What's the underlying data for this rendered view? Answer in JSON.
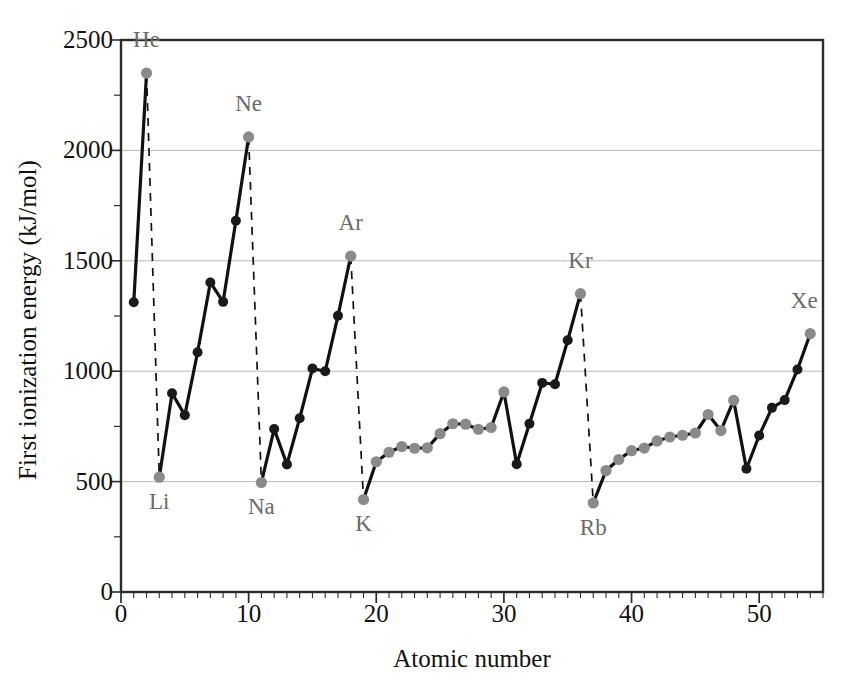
{
  "chart_data": {
    "type": "line",
    "title": "",
    "xlabel": "Atomic number",
    "ylabel": "First ionization energy (kJ/mol)",
    "xlim": [
      0,
      55
    ],
    "ylim": [
      0,
      2500
    ],
    "grid": true,
    "legend": null,
    "x_major_ticks": [
      0,
      10,
      20,
      30,
      40,
      50
    ],
    "x_tick_labels": [
      "0",
      "10",
      "20",
      "30",
      "40",
      "50"
    ],
    "x_minor_tick_step": 1,
    "y_major_ticks": [
      0,
      500,
      1000,
      1500,
      2000,
      2500
    ],
    "y_tick_labels": [
      "0",
      "500",
      "1000",
      "1500",
      "2000",
      "2500"
    ],
    "y_minor_tick_step": 250,
    "series_name": "First ionization energy",
    "x": [
      1,
      2,
      3,
      4,
      5,
      6,
      7,
      8,
      9,
      10,
      11,
      12,
      13,
      14,
      15,
      16,
      17,
      18,
      19,
      20,
      21,
      22,
      23,
      24,
      25,
      26,
      27,
      28,
      29,
      30,
      31,
      32,
      33,
      34,
      35,
      36,
      37,
      38,
      39,
      40,
      41,
      42,
      43,
      44,
      45,
      46,
      47,
      48,
      49,
      50,
      51,
      52,
      53,
      54
    ],
    "values": [
      1312,
      2350,
      520,
      900,
      801,
      1086,
      1402,
      1314,
      1681,
      2061,
      496,
      738,
      578,
      787,
      1012,
      1000,
      1251,
      1521,
      419,
      590,
      633,
      659,
      651,
      653,
      717,
      762,
      760,
      737,
      745,
      906,
      579,
      762,
      947,
      941,
      1140,
      1351,
      403,
      550,
      600,
      640,
      652,
      684,
      702,
      710,
      720,
      804,
      731,
      868,
      558,
      709,
      834,
      869,
      1008,
      1170
    ],
    "annotations": [
      {
        "element": "He",
        "x": 2,
        "y": 2350,
        "dx": 0,
        "dy": -26,
        "anchor": "middle"
      },
      {
        "element": "Ne",
        "x": 10,
        "y": 2061,
        "dx": 0,
        "dy": -26,
        "anchor": "middle"
      },
      {
        "element": "Ar",
        "x": 18,
        "y": 1521,
        "dx": 0,
        "dy": -26,
        "anchor": "middle"
      },
      {
        "element": "Kr",
        "x": 36,
        "y": 1351,
        "dx": 0,
        "dy": -26,
        "anchor": "middle"
      },
      {
        "element": "Xe",
        "x": 54,
        "y": 1170,
        "dx": -6,
        "dy": -26,
        "anchor": "middle"
      },
      {
        "element": "Li",
        "x": 3,
        "y": 520,
        "dx": 0,
        "dy": 32,
        "anchor": "middle"
      },
      {
        "element": "Na",
        "x": 11,
        "y": 496,
        "dx": 0,
        "dy": 32,
        "anchor": "middle"
      },
      {
        "element": "K",
        "x": 19,
        "y": 419,
        "dx": 0,
        "dy": 32,
        "anchor": "middle"
      },
      {
        "element": "Rb",
        "x": 37,
        "y": 403,
        "dx": 0,
        "dy": 32,
        "anchor": "middle"
      }
    ],
    "dashed_drops": [
      {
        "from_x": 2,
        "from_y": 2350,
        "to_x": 3,
        "to_y": 520
      },
      {
        "from_x": 10,
        "from_y": 2061,
        "to_x": 11,
        "to_y": 496
      },
      {
        "from_x": 18,
        "from_y": 1521,
        "to_x": 19,
        "to_y": 419
      },
      {
        "from_x": 36,
        "from_y": 1351,
        "to_x": 37,
        "to_y": 403
      }
    ],
    "gray_marker_atomic_numbers": [
      2,
      3,
      10,
      11,
      18,
      19,
      20,
      21,
      22,
      23,
      24,
      25,
      26,
      27,
      28,
      29,
      30,
      36,
      37,
      38,
      39,
      40,
      41,
      42,
      43,
      44,
      45,
      46,
      47,
      48,
      54
    ],
    "colors": {
      "line": "#111111",
      "marker_dark": "#1a1a1a",
      "marker_gray": "#8a8a8a",
      "grid": "#b9b9b9",
      "axis": "#2b2b2b",
      "annotation_text": "#6b6b6b",
      "background": "#ffffff"
    }
  }
}
